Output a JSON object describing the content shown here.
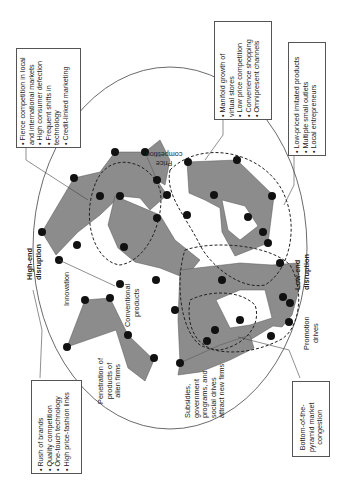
{
  "diagram": {
    "type": "market-dynamics-network-diagram",
    "orientation": "rotated-90-counterclockwise",
    "colors": {
      "fill": "#8c8c8c",
      "node": "#111111",
      "outline": "#444444",
      "background": "#ffffff"
    },
    "boxes": {
      "top_left": {
        "items": [
          "Fierce competition in local and international markets",
          "High consumer defection",
          "Frequent shifts in technology",
          "Credit-linked marketing"
        ],
        "lines": [
          "• Fierce competition in local",
          "  and international markets",
          "• High consumer defection",
          "• Frequent shifts in",
          "  technology",
          "• Credit-linked marketing"
        ]
      },
      "top_middle": {
        "items": [
          "Manifold growth of virtual stores",
          "Low price competition",
          "Convenience shopping",
          "Omnipresent channels"
        ],
        "lines": [
          "• Manifold growth of",
          "  virtual stores",
          "• Low price competition",
          "• Convenience shopping",
          "• Omnipresent channels"
        ]
      },
      "top_right": {
        "items": [
          "Low-priced imitated products",
          "Multiple small outlets",
          "Local entrepreneurs"
        ],
        "lines": [
          "• Low-priced imitated products",
          "• Multiple small outlets",
          "• Local entrepreneurs"
        ]
      },
      "bottom_left": {
        "items": [
          "Rush of brands",
          "Quality competition",
          "One-touch technology",
          "High price-fashion links"
        ],
        "lines": [
          "• Rush of brands",
          "• Quality competition",
          "• One-touch technology",
          "• High price-fashion links"
        ]
      },
      "bottom_right": {
        "text": "Bottom-of-the-pyramid market congestion",
        "lines": [
          "Bottom-of-the-",
          "pyramid market",
          "congestion"
        ]
      }
    },
    "labels": {
      "high_end": {
        "lines": [
          "High-end",
          "disruption"
        ]
      },
      "low_end": {
        "lines": [
          "Low-end",
          "disruption"
        ]
      },
      "innovation": "Innovation",
      "conventional": {
        "lines": [
          "Conventional",
          "products"
        ]
      },
      "penetration": {
        "lines": [
          "Penetration of",
          "products of",
          "alien firms"
        ]
      },
      "subsidies": {
        "lines": [
          "Subsidies,",
          "government",
          "programs, and",
          "social drives",
          "attract new firms"
        ]
      },
      "promotion": {
        "lines": [
          "Promotion",
          "drives"
        ]
      },
      "price_competition": {
        "lines": [
          "Price",
          "competition"
        ]
      }
    }
  }
}
